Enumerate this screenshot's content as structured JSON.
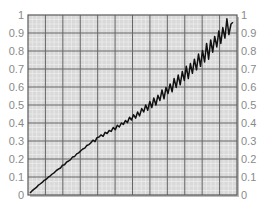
{
  "chart_data": {
    "type": "line",
    "title": "",
    "xlabel": "",
    "ylabel": "",
    "ylim": [
      0,
      1
    ],
    "xlim": [
      0,
      1
    ],
    "grid": true,
    "legend": null,
    "y_ticks_left": [
      "0",
      "0.1",
      "0.2",
      "0.3",
      "0.4",
      "0.5",
      "0.6",
      "0.7",
      "0.8",
      "0.9",
      "1"
    ],
    "y_ticks_right": [
      "0",
      "0.1",
      "0.2",
      "0.3",
      "0.4",
      "0.5",
      "0.6",
      "0.7",
      "0.8",
      "0.9",
      "1"
    ],
    "x_ticks": [],
    "series": [
      {
        "name": "series-1",
        "color": "#111111",
        "x": [
          0.0,
          0.02,
          0.04,
          0.06,
          0.08,
          0.1,
          0.12,
          0.14,
          0.16,
          0.18,
          0.2,
          0.22,
          0.24,
          0.26,
          0.28,
          0.3,
          0.32,
          0.34,
          0.36,
          0.38,
          0.4,
          0.42,
          0.44,
          0.46,
          0.48,
          0.5,
          0.52,
          0.54,
          0.56,
          0.58,
          0.6,
          0.62,
          0.64,
          0.66,
          0.68,
          0.7,
          0.72,
          0.74,
          0.76,
          0.78,
          0.8,
          0.82,
          0.84,
          0.86,
          0.88,
          0.9,
          0.92,
          0.94,
          0.96,
          0.98,
          1.0
        ],
        "values": [
          0.0,
          0.03,
          0.05,
          0.07,
          0.09,
          0.11,
          0.12,
          0.15,
          0.16,
          0.18,
          0.19,
          0.21,
          0.23,
          0.25,
          0.26,
          0.28,
          0.29,
          0.3,
          0.33,
          0.32,
          0.35,
          0.37,
          0.36,
          0.4,
          0.38,
          0.43,
          0.41,
          0.46,
          0.45,
          0.49,
          0.44,
          0.52,
          0.5,
          0.55,
          0.57,
          0.53,
          0.62,
          0.58,
          0.64,
          0.66,
          0.61,
          0.72,
          0.67,
          0.74,
          0.7,
          0.8,
          0.76,
          0.85,
          0.82,
          0.9,
          0.86
        ]
      }
    ]
  },
  "noise_series": {
    "x": [
      0.0,
      0.01,
      0.02,
      0.03,
      0.04,
      0.05,
      0.06,
      0.07,
      0.08,
      0.09,
      0.1,
      0.11,
      0.12,
      0.13,
      0.14,
      0.15,
      0.16,
      0.17,
      0.18,
      0.19,
      0.2,
      0.21,
      0.22,
      0.23,
      0.24,
      0.25,
      0.26,
      0.27,
      0.28,
      0.29,
      0.3,
      0.31,
      0.32,
      0.33,
      0.34,
      0.35,
      0.36,
      0.37,
      0.38,
      0.39,
      0.4,
      0.41,
      0.42,
      0.43,
      0.44,
      0.45,
      0.46,
      0.47,
      0.48,
      0.49,
      0.5,
      0.51,
      0.52,
      0.53,
      0.54,
      0.55,
      0.56,
      0.57,
      0.58,
      0.59,
      0.6,
      0.61,
      0.62,
      0.63,
      0.64,
      0.65,
      0.66,
      0.67,
      0.68,
      0.69,
      0.7,
      0.71,
      0.72,
      0.73,
      0.74,
      0.75,
      0.76,
      0.77,
      0.78,
      0.79,
      0.8,
      0.81,
      0.82,
      0.83,
      0.84,
      0.85,
      0.86,
      0.87,
      0.88,
      0.89,
      0.9,
      0.91,
      0.92,
      0.93,
      0.94,
      0.95,
      0.96,
      0.97,
      0.98,
      0.99,
      1.0
    ],
    "y": [
      0.0,
      0.012,
      0.022,
      0.03,
      0.043,
      0.051,
      0.06,
      0.072,
      0.078,
      0.09,
      0.098,
      0.108,
      0.116,
      0.128,
      0.135,
      0.142,
      0.158,
      0.16,
      0.175,
      0.182,
      0.19,
      0.205,
      0.208,
      0.222,
      0.228,
      0.24,
      0.25,
      0.255,
      0.27,
      0.275,
      0.285,
      0.3,
      0.292,
      0.315,
      0.318,
      0.33,
      0.322,
      0.345,
      0.338,
      0.355,
      0.35,
      0.372,
      0.36,
      0.385,
      0.375,
      0.398,
      0.39,
      0.412,
      0.4,
      0.43,
      0.415,
      0.445,
      0.425,
      0.46,
      0.438,
      0.48,
      0.46,
      0.5,
      0.47,
      0.52,
      0.485,
      0.54,
      0.5,
      0.555,
      0.525,
      0.585,
      0.535,
      0.6,
      0.565,
      0.62,
      0.575,
      0.65,
      0.6,
      0.67,
      0.615,
      0.69,
      0.64,
      0.72,
      0.65,
      0.735,
      0.68,
      0.76,
      0.7,
      0.79,
      0.72,
      0.81,
      0.745,
      0.85,
      0.76,
      0.87,
      0.8,
      0.89,
      0.83,
      0.92,
      0.85,
      0.94,
      0.88,
      0.99,
      0.9,
      0.96,
      0.97
    ]
  },
  "plot": {
    "left": 28,
    "top": 15,
    "right": 237,
    "bottom": 195,
    "background": "#d9d9d9",
    "major_grid_color": "#666666",
    "minor_grid_color": "#ffffff",
    "frame_color": "#555555",
    "major_x_divisions": 12,
    "major_y_divisions": 10,
    "minor_per_major": 4
  }
}
